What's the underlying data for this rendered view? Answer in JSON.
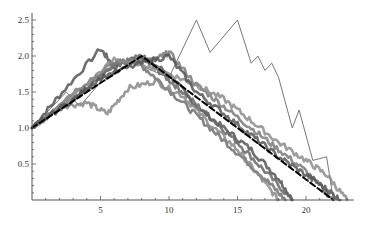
{
  "chart_data": {
    "type": "line",
    "title": "",
    "xlabel": "",
    "ylabel": "",
    "xlim": [
      0,
      23.5
    ],
    "ylim": [
      0,
      2.6
    ],
    "x_ticks": [
      5,
      10,
      15,
      20
    ],
    "y_ticks": [
      0.5,
      1.0,
      1.5,
      2.0,
      2.5
    ],
    "x_tick_labels": [
      "5",
      "10",
      "15",
      "20"
    ],
    "y_tick_labels": [
      "0.5",
      "1.0",
      "1.5",
      "2.0",
      "2.5"
    ],
    "grid": false,
    "legend": null,
    "series": [
      {
        "name": "mean (dashed)",
        "style": "dashed",
        "color": "#000000",
        "x": [
          0,
          8,
          22
        ],
        "y": [
          1.0,
          2.0,
          0.0
        ]
      },
      {
        "name": "thin path",
        "style": "thin",
        "color": "#777777",
        "x": [
          0,
          2.5,
          3.5,
          5.5,
          7.5,
          10,
          12,
          13,
          15,
          16,
          16.5,
          17,
          17.5,
          18,
          19,
          19.5,
          20.5,
          21.5,
          22
        ],
        "y": [
          1.0,
          1.5,
          1.3,
          1.75,
          1.9,
          1.7,
          2.5,
          2.05,
          2.5,
          1.9,
          2.0,
          1.8,
          1.9,
          1.7,
          1.0,
          1.25,
          0.55,
          0.6,
          0.0
        ]
      },
      {
        "name": "path 1",
        "style": "thick",
        "color": "#555555",
        "x": [
          0,
          2,
          5,
          6,
          8,
          10,
          12,
          14,
          16,
          18,
          19
        ],
        "y": [
          1.0,
          1.45,
          2.1,
          1.85,
          2.0,
          1.75,
          1.3,
          1.0,
          0.7,
          0.3,
          0.0
        ]
      },
      {
        "name": "path 2",
        "style": "thick",
        "color": "#666666",
        "x": [
          0,
          3,
          6,
          8,
          9.5,
          11,
          13,
          15,
          17,
          19
        ],
        "y": [
          1.0,
          1.4,
          1.85,
          2.0,
          1.75,
          1.5,
          1.15,
          0.8,
          0.4,
          0.0
        ]
      },
      {
        "name": "path 3",
        "style": "thick",
        "color": "#707070",
        "x": [
          0,
          3,
          6,
          7.5,
          9,
          11,
          13,
          15,
          17,
          18.5
        ],
        "y": [
          1.0,
          1.4,
          1.9,
          1.95,
          1.7,
          1.35,
          1.0,
          0.65,
          0.3,
          0.0
        ]
      },
      {
        "name": "path 4",
        "style": "thick",
        "color": "#888888",
        "x": [
          0,
          2,
          4,
          5.5,
          7,
          9,
          11,
          13,
          15,
          16.5,
          18
        ],
        "y": [
          1.0,
          1.3,
          1.35,
          1.2,
          1.55,
          1.65,
          1.45,
          1.05,
          0.7,
          0.35,
          0.0
        ]
      },
      {
        "name": "path 5",
        "style": "thick",
        "color": "#7a7a7a",
        "x": [
          0,
          3,
          6,
          9,
          10,
          12,
          14,
          16,
          18,
          20,
          22
        ],
        "y": [
          1.0,
          1.5,
          1.9,
          1.95,
          2.05,
          1.6,
          1.3,
          1.0,
          0.7,
          0.4,
          0.0
        ]
      },
      {
        "name": "path 6",
        "style": "thick",
        "color": "#8c8c8c",
        "x": [
          0,
          3,
          6,
          8,
          10,
          12,
          14,
          16,
          18,
          20,
          21.5,
          23
        ],
        "y": [
          1.0,
          1.45,
          1.95,
          1.9,
          1.75,
          1.6,
          1.4,
          1.1,
          0.8,
          0.55,
          0.35,
          0.0
        ]
      },
      {
        "name": "path 7",
        "style": "thick",
        "color": "#555555",
        "x": [
          0,
          3,
          5,
          8,
          10,
          12,
          14,
          16,
          18,
          20,
          21.5,
          22.5
        ],
        "y": [
          1.0,
          1.4,
          1.7,
          1.9,
          2.0,
          1.5,
          1.2,
          0.9,
          0.6,
          0.35,
          0.15,
          0.0
        ]
      }
    ]
  }
}
